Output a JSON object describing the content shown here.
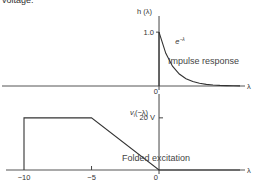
{
  "header_text": "voltage.",
  "chart_data": [
    {
      "type": "line",
      "title": "Impulse response",
      "ylabel": "h (λ)",
      "xlabel": "λ",
      "annotation": "e^−λ",
      "annotation_base": "e",
      "annotation_exp": "−λ",
      "y_ticks": [
        {
          "value": 1.0,
          "label": "1.0"
        }
      ],
      "x_ticks": [
        {
          "value": 0,
          "label": "0"
        }
      ],
      "xlim": [
        -10.3,
        6
      ],
      "ylim": [
        0,
        1.3
      ],
      "series": [
        {
          "name": "h(λ) = e^−λ for λ ≥ 0",
          "step_at_zero": true,
          "x": [
            0,
            0.5,
            1,
            1.5,
            2,
            2.5,
            3,
            3.5,
            4,
            4.5,
            5,
            5.5,
            6
          ],
          "y": [
            1.0,
            0.607,
            0.368,
            0.223,
            0.135,
            0.082,
            0.05,
            0.03,
            0.018,
            0.011,
            0.007,
            0.004,
            0.0025
          ]
        }
      ],
      "grid": false
    },
    {
      "type": "line",
      "title": "Folded excitation",
      "ylabel": "v_i(−λ)",
      "ylabel_base": "v",
      "ylabel_sub": "i",
      "ylabel_rest": "(−λ)",
      "xlabel": "λ",
      "y_ticks": [
        {
          "value": 20,
          "label": "20 V"
        }
      ],
      "x_ticks": [
        {
          "value": -10,
          "label": "−10"
        },
        {
          "value": -5,
          "label": "−5"
        },
        {
          "value": 0,
          "label": "0"
        }
      ],
      "xlim": [
        -10.3,
        6
      ],
      "ylim": [
        0,
        28
      ],
      "series": [
        {
          "name": "v_i(−λ)",
          "x": [
            -10,
            -10,
            -5,
            0,
            6
          ],
          "y": [
            0,
            20,
            20,
            0,
            0
          ]
        }
      ],
      "grid": false
    }
  ]
}
